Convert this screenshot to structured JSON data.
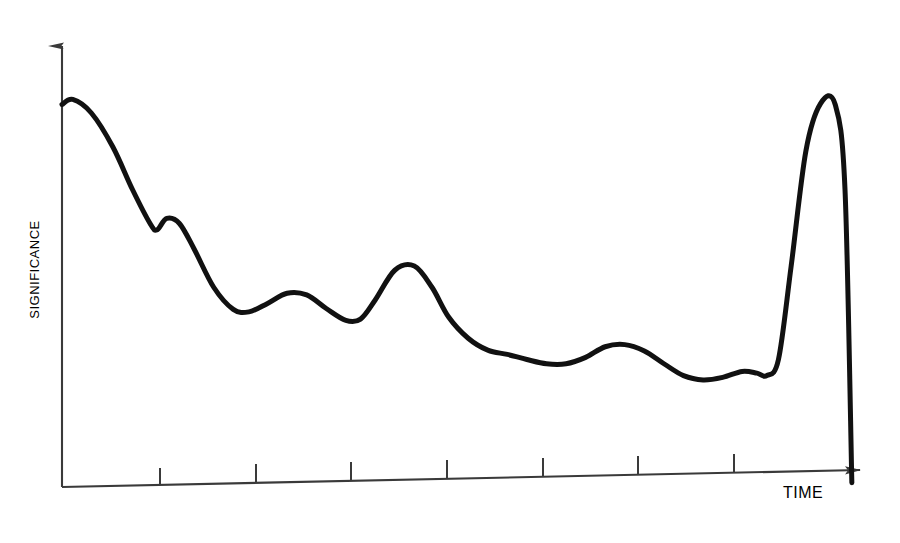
{
  "figure": {
    "background_color": "#ffffff",
    "line_color": "#111111",
    "axis_color": "#3a3a3a"
  },
  "axes": {
    "y_label": "SIGNIFICANCE",
    "x_label": "TIME",
    "y_axis_name": "significance-axis",
    "x_axis_name": "time-axis"
  },
  "chart_data": {
    "type": "line",
    "title": "",
    "subtitle": "",
    "xlabel": "TIME",
    "ylabel": "SIGNIFICANCE",
    "xlim": [
      0,
      8
    ],
    "ylim": [
      0,
      1
    ],
    "grid": false,
    "legend": null,
    "annotations": [],
    "axis_style": {
      "y_arrow": true,
      "x_arrow": true,
      "x_axis_tilted": true,
      "tick_labels_shown": false,
      "tick_count": 7,
      "tick_direction": "up"
    },
    "x_tick_positions": [
      1,
      2,
      3,
      4,
      5,
      6,
      7
    ],
    "x_tick_labels": [
      "",
      "",
      "",
      "",
      "",
      "",
      ""
    ],
    "series": [
      {
        "name": "significance",
        "x": [
          0.0,
          0.11,
          0.3,
          0.52,
          0.72,
          0.9,
          0.97,
          1.07,
          1.2,
          1.35,
          1.55,
          1.75,
          1.91,
          2.1,
          2.3,
          2.5,
          2.7,
          2.9,
          3.05,
          3.2,
          3.4,
          3.6,
          3.78,
          3.95,
          4.15,
          4.35,
          4.55,
          4.75,
          4.95,
          5.15,
          5.35,
          5.55,
          5.75,
          5.95,
          6.15,
          6.35,
          6.55,
          6.75,
          6.95,
          7.1,
          7.2,
          7.32,
          7.45,
          7.6,
          7.75,
          7.9,
          8.0,
          8.07
        ],
        "y": [
          0.9,
          0.912,
          0.88,
          0.8,
          0.7,
          0.62,
          0.605,
          0.632,
          0.62,
          0.56,
          0.47,
          0.418,
          0.412,
          0.432,
          0.456,
          0.452,
          0.42,
          0.392,
          0.395,
          0.44,
          0.51,
          0.52,
          0.47,
          0.4,
          0.35,
          0.322,
          0.312,
          0.3,
          0.29,
          0.29,
          0.305,
          0.33,
          0.335,
          0.32,
          0.29,
          0.262,
          0.252,
          0.258,
          0.272,
          0.268,
          0.262,
          0.3,
          0.52,
          0.79,
          0.902,
          0.9,
          0.7,
          0.01
        ],
        "peak_points": [
          {
            "label": "initial peak",
            "x": 0.14,
            "y": 0.912
          },
          {
            "label": "terminal spike peak",
            "x": 7.74,
            "y": 0.905
          }
        ],
        "color": "#111111",
        "line_width": 5
      }
    ]
  }
}
